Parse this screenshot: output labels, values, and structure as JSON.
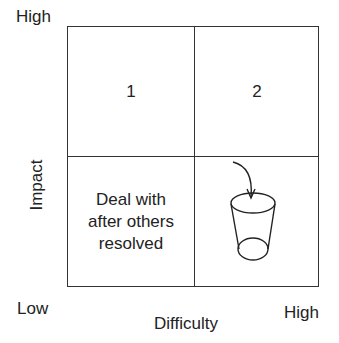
{
  "axes": {
    "y_high": "High",
    "y_label": "Impact",
    "x_low": "Low",
    "x_label": "Difficulty",
    "x_high": "High"
  },
  "quadrants": {
    "top_left": "1",
    "top_right": "2",
    "bottom_left": "Deal with after others resolved",
    "bottom_right_icon": "trash-bin-with-arrow"
  },
  "colors": {
    "line": "#333333",
    "background": "#ffffff"
  }
}
